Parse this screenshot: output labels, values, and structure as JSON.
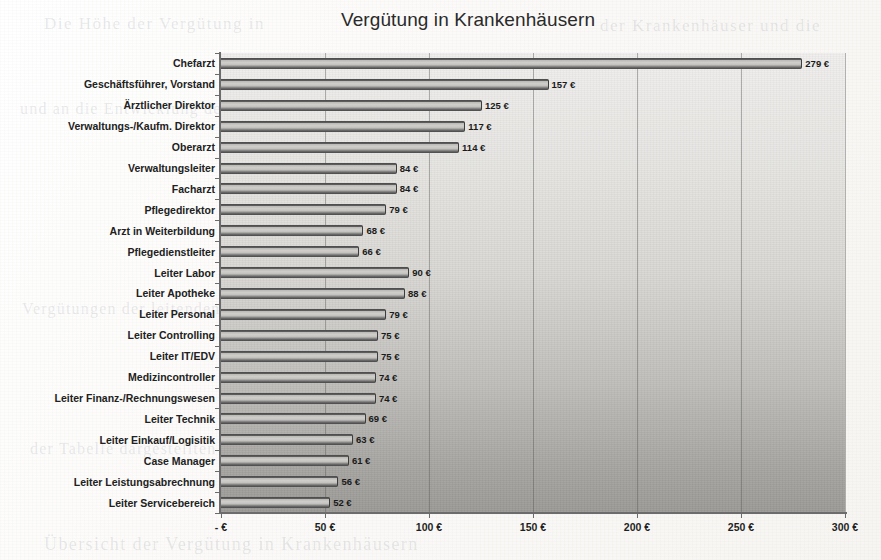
{
  "chart_data": {
    "type": "bar",
    "orientation": "horizontal",
    "title": "Vergütung in Krankenhäusern",
    "xlabel": "",
    "ylabel": "",
    "xlim": [
      0,
      300
    ],
    "grid": true,
    "legend": false,
    "value_suffix": " €",
    "categories": [
      "Chefarzt",
      "Geschäftsführer, Vorstand",
      "Ärztlicher Direktor",
      "Verwaltungs-/Kaufm. Direktor",
      "Oberarzt",
      "Verwaltungsleiter",
      "Facharzt",
      "Pflegedirektor",
      "Arzt in Weiterbildung",
      "Pflegedienstleiter",
      "Leiter Labor",
      "Leiter Apotheke",
      "Leiter Personal",
      "Leiter Controlling",
      "Leiter IT/EDV",
      "Medizincontroller",
      "Leiter Finanz-/Rechnungswesen",
      "Leiter Technik",
      "Leiter Einkauf/Logisitik",
      "Case Manager",
      "Leiter Leistungsabrechnung",
      "Leiter Servicebereich"
    ],
    "values": [
      279,
      157,
      125,
      117,
      114,
      84,
      84,
      79,
      68,
      66,
      90,
      88,
      79,
      75,
      75,
      74,
      74,
      69,
      63,
      61,
      56,
      52
    ],
    "value_labels": [
      "279 €",
      "157 €",
      "125 €",
      "117 €",
      "114 €",
      "84 €",
      "84 €",
      "79 €",
      "68 €",
      "66 €",
      "90 €",
      "88 €",
      "79 €",
      "75 €",
      "75 €",
      "74 €",
      "74 €",
      "69 €",
      "63 €",
      "61 €",
      "56 €",
      "52 €"
    ],
    "xticks": [
      0,
      50,
      100,
      150,
      200,
      250,
      300
    ],
    "xtick_labels": [
      "-   €",
      "50 €",
      "100 €",
      "150 €",
      "200 €",
      "250 €",
      "300 €"
    ],
    "colors": {
      "bar_fill": "#c6c5c1",
      "bar_edge": "#4a4a4a",
      "plot_background_top": "#f0efed",
      "plot_background_bottom": "#9b9a96",
      "gridline": "#5a5a5a",
      "text": "#1e1e1e"
    }
  },
  "page": {
    "ghost_text": {
      "line_a": "Die   Höhe   der   Vergütung   in",
      "line_b": "der  Krankenhäuser  und  die",
      "line_c": "und  an  die  Entwicklung  der",
      "line_d": "Vergütungen  der  leitenden",
      "line_e": "der  Tabelle  dargestellten",
      "line_f": "Übersicht der Vergütung in Krankenhäusern"
    }
  }
}
